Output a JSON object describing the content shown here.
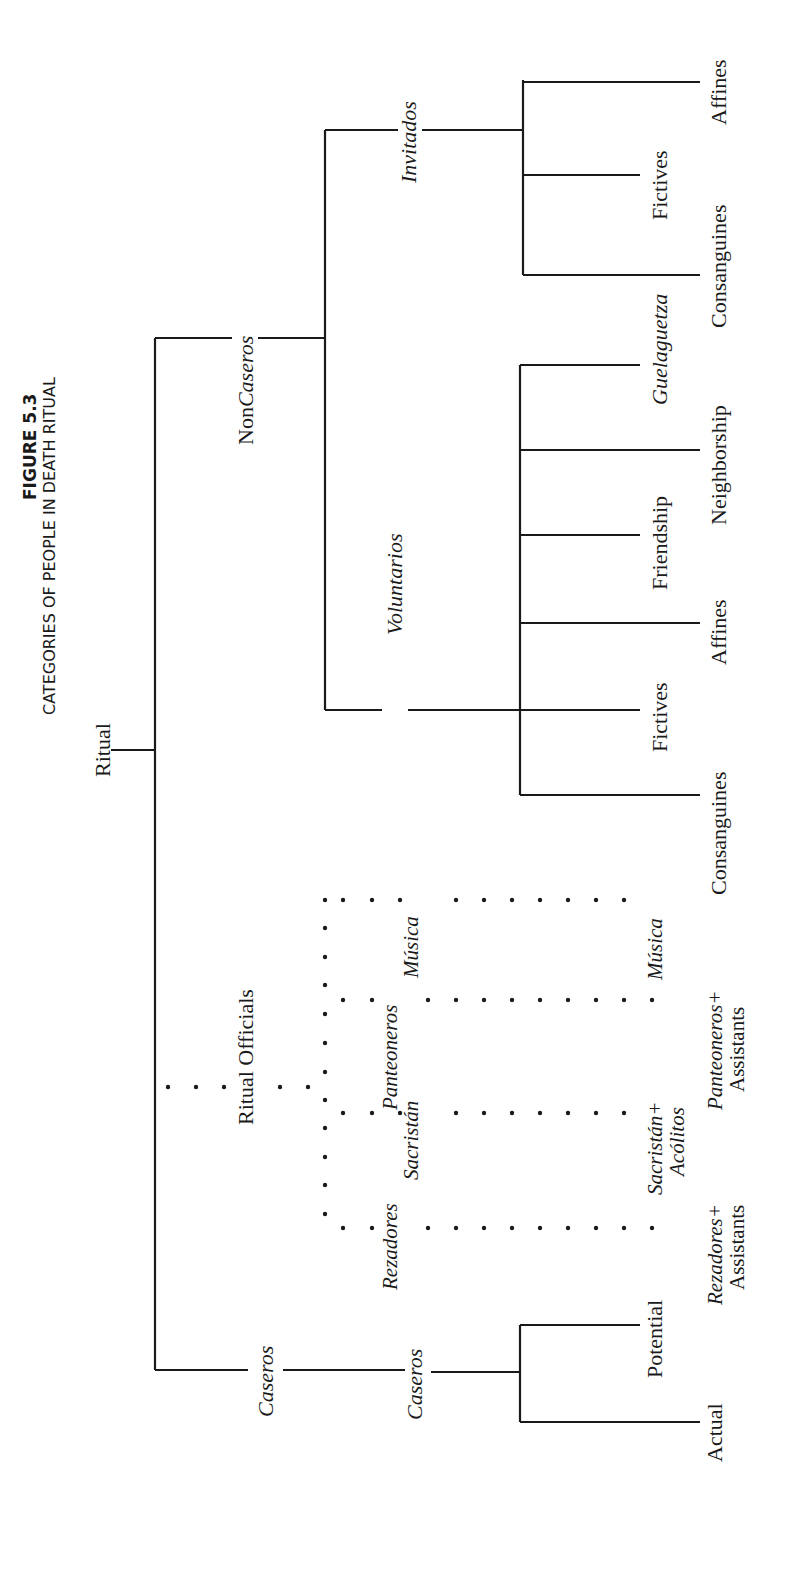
{
  "figure": {
    "number": "FIGURE 5.3",
    "title": "CATEGORIES OF PEOPLE IN DEATH RITUAL"
  },
  "tree": {
    "root": "Ritual",
    "noncaseros": {
      "label_prefix": "Non",
      "label_italic": "Caseros",
      "invitados": {
        "label": "Invitados",
        "leaves": [
          "Affines",
          "Fictives",
          "Consanguines"
        ]
      },
      "voluntarios": {
        "label": "Voluntarios",
        "leaves": [
          "Guelaguetza",
          "Neighborship",
          "Friendship",
          "Affines",
          "Fictives",
          "Consanguines"
        ]
      }
    },
    "ritual_officials": {
      "label": "Ritual Officials",
      "roles": [
        "Rezadores",
        "Sacristán",
        "Panteoneros",
        "Música"
      ],
      "leaves": [
        {
          "line1": "Rezadores+",
          "line2": "Assistants"
        },
        {
          "line1": "Sacristán+",
          "line2": "Acólitos"
        },
        {
          "line1": "Panteoneros+",
          "line2": "Assistants"
        },
        {
          "line1": "Música",
          "line2": ""
        }
      ]
    },
    "caseros": {
      "label": "Caseros",
      "sub_label": "Caseros",
      "leaves": [
        "Potential",
        "Actual"
      ]
    }
  }
}
